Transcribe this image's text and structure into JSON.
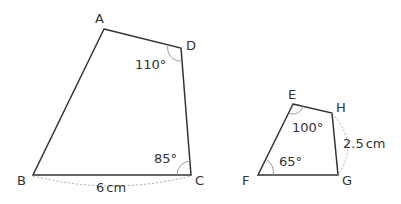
{
  "figure1": {
    "vertices": {
      "A": "A",
      "B": "B",
      "C": "C",
      "D": "D"
    },
    "angle_D": "110°",
    "angle_C": "85°",
    "side_BC": "6",
    "side_BC_unit": "cm"
  },
  "figure2": {
    "vertices": {
      "E": "E",
      "F": "F",
      "G": "G",
      "H": "H"
    },
    "angle_E": "100°",
    "angle_F": "65°",
    "side_HG": "2.5",
    "side_HG_unit": "cm"
  },
  "colors": {
    "line": "#333333",
    "arc": "#999999",
    "dashed": "#aaaaaa"
  }
}
